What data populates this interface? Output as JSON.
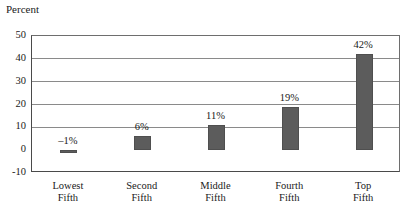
{
  "chart_data": {
    "type": "bar",
    "title": "",
    "subtitle": "",
    "ylabel": "Percent",
    "xlabel": "",
    "categories": [
      "Lowest Fifth",
      "Second Fifth",
      "Middle Fifth",
      "Fourth Fifth",
      "Top Fifth"
    ],
    "category_lines": [
      [
        "Lowest",
        "Fifth"
      ],
      [
        "Second",
        "Fifth"
      ],
      [
        "Middle",
        "Fifth"
      ],
      [
        "Fourth",
        "Fifth"
      ],
      [
        "Top",
        "Fifth"
      ]
    ],
    "values": [
      -1,
      6,
      11,
      19,
      42
    ],
    "data_labels": [
      "–1%",
      "6%",
      "11%",
      "19%",
      "42%"
    ],
    "ylim": [
      -10,
      50
    ],
    "yticks": [
      50,
      40,
      30,
      20,
      10,
      0,
      -10
    ],
    "ytick_labels": [
      "50",
      "40",
      "30",
      "20",
      "10",
      "0",
      "-10"
    ],
    "grid": true,
    "grid_axis": "y",
    "legend": "none",
    "bar_color": "#5c5c5c",
    "bar_edge_color": "#4f4f4f",
    "grid_color": "#8a8a8a",
    "axis_color": "#4a4a4a",
    "background": "#ffffff"
  }
}
